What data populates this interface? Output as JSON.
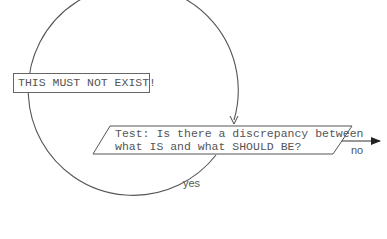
{
  "diagram": {
    "type": "flowchart-loop",
    "loop_node": {
      "label": "THIS MUST NOT EXIST!"
    },
    "decision_node": {
      "line1": "Test: Is there a discrepancy between",
      "line2": "what IS and what SHOULD BE?"
    },
    "edges": {
      "yes_label": "yes",
      "no_label": "no"
    },
    "colors": {
      "stroke": "#555555",
      "text": "#555555",
      "background": "#ffffff"
    }
  }
}
